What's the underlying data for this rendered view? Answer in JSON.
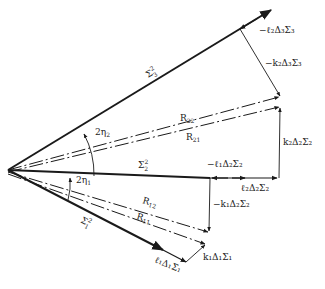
{
  "diagram": {
    "colors": {
      "line": "#1a1a1a",
      "text": "#222222",
      "background": "#ffffff"
    },
    "origin": {
      "x": 8,
      "y": 170
    },
    "vectors": [
      {
        "id": "sigma3",
        "label": "Σ₃²",
        "style": "thick"
      },
      {
        "id": "sigma2",
        "label": "Σ₂²",
        "style": "thick"
      },
      {
        "id": "sigma1",
        "label": "Σ₁²",
        "style": "thick"
      },
      {
        "id": "R22",
        "label": "R₂₂",
        "style": "dashed"
      },
      {
        "id": "R21",
        "label": "R₂₁",
        "style": "dashed"
      },
      {
        "id": "R12",
        "label": "R₁₂",
        "style": "dashed"
      },
      {
        "id": "R11",
        "label": "R₁₁",
        "style": "dashed"
      }
    ],
    "labels": {
      "sigma3": "Σ",
      "sigma3_sup": "2",
      "sigma3_sub": "3",
      "sigma2": "Σ",
      "sigma2_sup": "2",
      "sigma2_sub": "2",
      "sigma1": "Σ",
      "sigma1_sup": "2",
      "sigma1_sub": "1",
      "R22": "R",
      "R22_sub": "22",
      "R21": "R",
      "R21_sub": "21",
      "R12": "R",
      "R12_sub": "12",
      "R11": "R",
      "R11_sub": "11",
      "angle2": "2η",
      "angle2_sub": "2",
      "angle1": "2η",
      "angle1_sub": "1",
      "neg_l2_d3_s3": "−ℓ₂Δ₃Σ₃",
      "neg_k2_d3_s3": "−k₂Δ₃Σ₃",
      "k2_d2_s2": "k₂Δ₂Σ₂",
      "neg_l1_d2_s2": "−ℓ₁Δ₂Σ₂",
      "l2_d2_s2": "ℓ₂Δ₂Σ₂",
      "neg_k1_d2_s2": "−k₁Δ₂Σ₂",
      "k1_d1_s1": "k₁Δ₁Σ₁",
      "l1_d1_s1": "ℓ₁Δ₁Σ₁"
    }
  }
}
